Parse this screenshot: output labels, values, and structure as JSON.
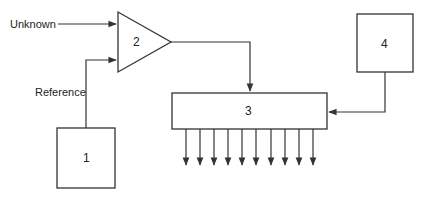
{
  "diagram": {
    "inputs": {
      "unknown_label": "Unknown",
      "reference_label": "Reference"
    },
    "blocks": [
      {
        "id": "1",
        "label": "1",
        "shape": "rectangle"
      },
      {
        "id": "2",
        "label": "2",
        "shape": "triangle-amplifier"
      },
      {
        "id": "3",
        "label": "3",
        "shape": "rectangle"
      },
      {
        "id": "4",
        "label": "4",
        "shape": "rectangle"
      }
    ],
    "connections": [
      {
        "from": "Unknown",
        "to": "2"
      },
      {
        "from": "1",
        "to": "2",
        "label": "Reference"
      },
      {
        "from": "2",
        "to": "3"
      },
      {
        "from": "4",
        "to": "3"
      }
    ],
    "outputs_count": 10,
    "colors": {
      "line": "#333333",
      "text": "#222222",
      "background": "#ffffff"
    }
  }
}
